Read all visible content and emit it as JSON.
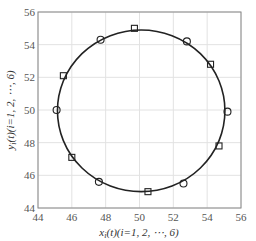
{
  "chart_data": {
    "type": "scatter",
    "title": "",
    "xlabel": "x_i(t)(i=1, 2, ⋯, 6)",
    "ylabel": "y_i(t)(i=1, 2, ⋯, 6)",
    "xlim": [
      44,
      56
    ],
    "ylim": [
      44,
      56
    ],
    "xticks": [
      44,
      46,
      48,
      50,
      52,
      54,
      56
    ],
    "yticks": [
      44,
      46,
      48,
      50,
      52,
      54,
      56
    ],
    "grid": true,
    "legend": null,
    "series": [
      {
        "name": "trajectory",
        "style": "line",
        "shape": "circle",
        "center": [
          50.1,
          49.95
        ],
        "radius": 4.95,
        "color": "#222222"
      },
      {
        "name": "circle markers",
        "style": "marker",
        "marker": "o",
        "points": [
          [
            45.1,
            50.0
          ],
          [
            47.7,
            54.3
          ],
          [
            52.8,
            54.2
          ],
          [
            55.2,
            49.9
          ],
          [
            52.6,
            45.5
          ],
          [
            47.6,
            45.6
          ]
        ]
      },
      {
        "name": "square markers",
        "style": "marker",
        "marker": "s",
        "points": [
          [
            45.5,
            52.1
          ],
          [
            49.7,
            55.0
          ],
          [
            54.2,
            52.8
          ],
          [
            54.7,
            47.8
          ],
          [
            50.5,
            45.0
          ],
          [
            46.0,
            47.1
          ]
        ]
      }
    ]
  },
  "labels": {
    "x_main": "x",
    "x_sub": "i",
    "x_rest": "(t)(i=1, 2, ⋯, 6)",
    "y_main": "y",
    "y_sub": "i",
    "y_rest": "(t)(i=1, 2, ⋯, 6)"
  },
  "colors": {
    "axis": "#888888",
    "grid": "#e2e2e2",
    "line": "#222222"
  }
}
